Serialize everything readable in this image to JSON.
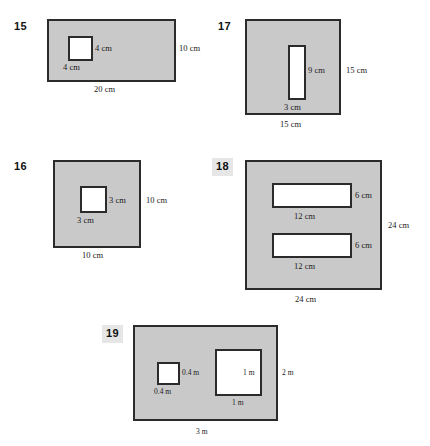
{
  "page": {
    "title": "Area of composite figures worksheet",
    "background_color": "#ffffff",
    "shape_fill_color": "#c9c9c9",
    "shape_stroke_color": "#2b2b2b",
    "hole_fill_color": "#ffffff",
    "number_box_color": "#e6e6e6"
  },
  "problems": [
    {
      "number": "15",
      "numbered_box": false,
      "outer_shape": "rectangle",
      "outer_width_label": "20 cm",
      "outer_height_label": "10 cm",
      "holes": [
        {
          "shape": "square",
          "width_label": "4 cm",
          "height_label": "4 cm"
        }
      ]
    },
    {
      "number": "16",
      "numbered_box": false,
      "outer_shape": "square",
      "outer_width_label": "10 cm",
      "outer_height_label": "10 cm",
      "holes": [
        {
          "shape": "square",
          "width_label": "3 cm",
          "height_label": "3 cm"
        }
      ]
    },
    {
      "number": "17",
      "numbered_box": false,
      "outer_shape": "square",
      "outer_width_label": "15 cm",
      "outer_height_label": "15 cm",
      "holes": [
        {
          "shape": "rectangle",
          "width_label": "3 cm",
          "height_label": "9 cm"
        }
      ]
    },
    {
      "number": "18",
      "numbered_box": true,
      "outer_shape": "square",
      "outer_width_label": "24 cm",
      "outer_height_label": "24 cm",
      "holes": [
        {
          "shape": "rectangle",
          "width_label": "12 cm",
          "height_label": "6 cm"
        },
        {
          "shape": "rectangle",
          "width_label": "12 cm",
          "height_label": "6 cm"
        }
      ]
    },
    {
      "number": "19",
      "numbered_box": true,
      "outer_shape": "rectangle",
      "outer_width_label": "3 m",
      "outer_height_label": "2 m",
      "holes": [
        {
          "shape": "square",
          "width_label": "0.4 m",
          "height_label": "0.4 m"
        },
        {
          "shape": "square",
          "width_label": "1 m",
          "height_label": "1 m"
        }
      ]
    }
  ]
}
